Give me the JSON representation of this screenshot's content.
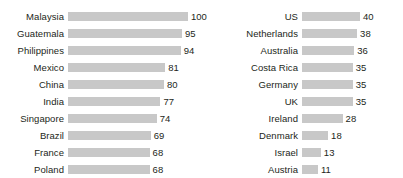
{
  "chart_data": [
    {
      "type": "bar",
      "orientation": "horizontal",
      "panel": "left",
      "title": "",
      "xlabel": "",
      "ylabel": "",
      "xlim": [
        0,
        100
      ],
      "grid": false,
      "legend": false,
      "bar_color": "#c8c8c8",
      "text_color": "#231f20",
      "categories": [
        "Malaysia",
        "Guatemala",
        "Philippines",
        "Mexico",
        "China",
        "India",
        "Singapore",
        "Brazil",
        "France",
        "Poland"
      ],
      "values": [
        100,
        95,
        94,
        81,
        80,
        77,
        74,
        69,
        68,
        68
      ],
      "rows": [
        {
          "label": "Malaysia",
          "value": 100,
          "value_text": "100"
        },
        {
          "label": "Guatemala",
          "value": 95,
          "value_text": "95"
        },
        {
          "label": "Philippines",
          "value": 94,
          "value_text": "94"
        },
        {
          "label": "Mexico",
          "value": 81,
          "value_text": "81"
        },
        {
          "label": "China",
          "value": 80,
          "value_text": "80"
        },
        {
          "label": "India",
          "value": 77,
          "value_text": "77"
        },
        {
          "label": "Singapore",
          "value": 74,
          "value_text": "74"
        },
        {
          "label": "Brazil",
          "value": 69,
          "value_text": "69"
        },
        {
          "label": "France",
          "value": 68,
          "value_text": "68"
        },
        {
          "label": "Poland",
          "value": 68,
          "value_text": "68"
        }
      ],
      "bar_max_px": 120
    },
    {
      "type": "bar",
      "orientation": "horizontal",
      "panel": "right",
      "title": "",
      "xlabel": "",
      "ylabel": "",
      "xlim": [
        0,
        40
      ],
      "grid": false,
      "legend": false,
      "bar_color": "#c8c8c8",
      "text_color": "#231f20",
      "categories": [
        "US",
        "Netherlands",
        "Australia",
        "Costa Rica",
        "Germany",
        "UK",
        "Ireland",
        "Denmark",
        "Israel",
        "Austria"
      ],
      "values": [
        40,
        38,
        36,
        35,
        35,
        35,
        28,
        18,
        13,
        11
      ],
      "rows": [
        {
          "label": "US",
          "value": 40,
          "value_text": "40"
        },
        {
          "label": "Netherlands",
          "value": 38,
          "value_text": "38"
        },
        {
          "label": "Australia",
          "value": 36,
          "value_text": "36"
        },
        {
          "label": "Costa Rica",
          "value": 35,
          "value_text": "35"
        },
        {
          "label": "Germany",
          "value": 35,
          "value_text": "35"
        },
        {
          "label": "UK",
          "value": 35,
          "value_text": "35"
        },
        {
          "label": "Ireland",
          "value": 28,
          "value_text": "28"
        },
        {
          "label": "Denmark",
          "value": 18,
          "value_text": "18"
        },
        {
          "label": "Israel",
          "value": 13,
          "value_text": "13"
        },
        {
          "label": "Austria",
          "value": 11,
          "value_text": "11"
        }
      ],
      "bar_max_px": 58
    }
  ]
}
